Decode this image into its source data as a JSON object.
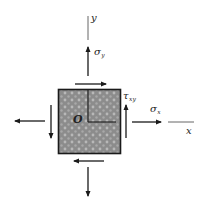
{
  "figure": {
    "type": "plane-stress-element",
    "colors": {
      "ink": "#1a1a1a",
      "element_fill": "#8c8c8c",
      "element_dots": "#b8b8b8",
      "background": "#ffffff"
    },
    "axes": {
      "x_label": "x",
      "y_label": "y",
      "origin_label": "O"
    },
    "stresses": {
      "sigma_x": {
        "symbol": "σ",
        "subscript": "x"
      },
      "sigma_y": {
        "symbol": "σ",
        "subscript": "y"
      },
      "tau_xy": {
        "symbol": "τ",
        "subscript": "xy"
      }
    }
  }
}
